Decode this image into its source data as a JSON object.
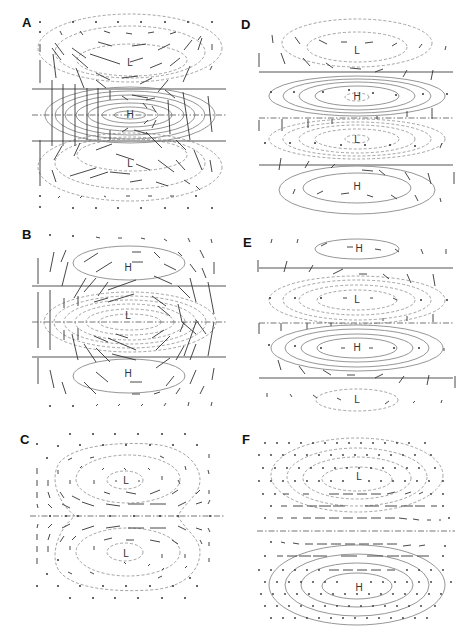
{
  "figure": {
    "panels": [
      {
        "id": "A",
        "label": "A",
        "centers": [
          {
            "text": "L",
            "role": "upper-low"
          },
          {
            "text": "H",
            "role": "equatorial-high"
          },
          {
            "text": "L",
            "role": "lower-low"
          }
        ]
      },
      {
        "id": "B",
        "label": "B",
        "centers": [
          {
            "text": "H",
            "role": "upper-high"
          },
          {
            "text": "L",
            "role": "equatorial-low"
          },
          {
            "text": "H",
            "role": "lower-high"
          }
        ]
      },
      {
        "id": "C",
        "label": "C",
        "centers": [
          {
            "text": "L",
            "role": "upper-low"
          },
          {
            "text": "L",
            "role": "lower-low"
          }
        ]
      },
      {
        "id": "D",
        "label": "D",
        "centers": [
          {
            "text": "L",
            "role": "top-low"
          },
          {
            "text": "H",
            "role": "upper-high"
          },
          {
            "text": "L",
            "role": "lower-low"
          },
          {
            "text": "H",
            "role": "bottom-high"
          }
        ]
      },
      {
        "id": "E",
        "label": "E",
        "centers": [
          {
            "text": "H",
            "role": "top-high"
          },
          {
            "text": "L",
            "role": "upper-low"
          },
          {
            "text": "H",
            "role": "lower-high"
          },
          {
            "text": "L",
            "role": "bottom-low"
          }
        ]
      },
      {
        "id": "F",
        "label": "F",
        "centers": [
          {
            "text": "L",
            "role": "upper-low"
          },
          {
            "text": "H",
            "role": "lower-high"
          }
        ]
      }
    ],
    "legend": {
      "solid_contour": "positive (high) anomaly",
      "dashed_contour": "negative (low) anomaly",
      "dash_dot_line": "equator",
      "arrows": "wind vectors"
    }
  }
}
